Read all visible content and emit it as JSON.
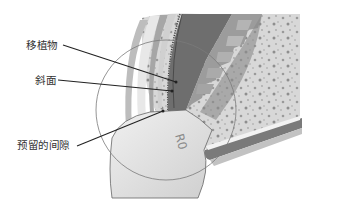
{
  "diagram": {
    "labels": [
      {
        "id": "implant",
        "text": "移植物",
        "x": 26,
        "y": 39,
        "line": [
          [
            62,
            45
          ],
          [
            176,
            82
          ]
        ]
      },
      {
        "id": "bevel",
        "text": "斜面",
        "x": 35,
        "y": 74,
        "line": [
          [
            58,
            80
          ],
          [
            172,
            91
          ]
        ]
      },
      {
        "id": "reserved-gap",
        "text": "预留的间隙",
        "x": 17,
        "y": 139,
        "line": [
          [
            77,
            146
          ],
          [
            163,
            111
          ]
        ]
      }
    ],
    "crown_marking": "R0",
    "colors": {
      "background": "#ffffff",
      "bone": "#d6d6d6",
      "bone_speckle": "#9a9a9a",
      "implant_dark": "#6e6e6e",
      "implant_mid": "#9c9c9c",
      "gum": "#b4b4b4",
      "crown": "#e4e4e4",
      "outline": "#555555",
      "leader_line": "#222222",
      "label_text": "#333333"
    }
  }
}
